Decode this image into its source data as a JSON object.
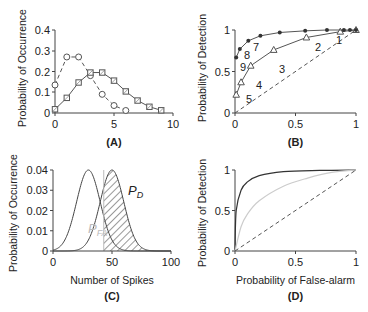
{
  "chart_data": [
    {
      "panel": "A",
      "type": "line",
      "caption": "(A)",
      "xlabel": "",
      "ylabel": "Probability of Occurrence",
      "xlim": [
        0,
        10
      ],
      "ylim": [
        0,
        0.4
      ],
      "xticks": [
        "0",
        "5",
        "10"
      ],
      "yticks": [
        "0",
        "0.1",
        "0.2",
        "0.3",
        "0.4"
      ],
      "series": [
        {
          "name": "circles (dashed)",
          "marker": "circle",
          "line": "dashed",
          "x": [
            0,
            1,
            2,
            3,
            4,
            5,
            6
          ],
          "values": [
            0.135,
            0.27,
            0.27,
            0.18,
            0.09,
            0.036,
            0.012
          ]
        },
        {
          "name": "squares (solid)",
          "marker": "square",
          "line": "solid",
          "x": [
            0,
            1,
            2,
            3,
            4,
            5,
            6,
            7,
            8,
            9
          ],
          "values": [
            0.018,
            0.073,
            0.147,
            0.195,
            0.195,
            0.156,
            0.104,
            0.06,
            0.03,
            0.013
          ]
        }
      ]
    },
    {
      "panel": "B",
      "type": "line",
      "caption": "(B)",
      "xlabel": "",
      "ylabel": "Probability of Detection",
      "xlim": [
        0,
        1
      ],
      "ylim": [
        0,
        1
      ],
      "xticks": [
        "0",
        "0.5",
        "1"
      ],
      "yticks": [
        "0",
        "0.5",
        "1"
      ],
      "series": [
        {
          "name": "triangles",
          "marker": "triangle",
          "line": "solid",
          "x": [
            0.01,
            0.05,
            0.13,
            0.32,
            0.59,
            0.87,
            1.0
          ],
          "values": [
            0.22,
            0.37,
            0.57,
            0.76,
            0.91,
            0.98,
            1.0
          ],
          "labels": [
            "",
            "5",
            "4",
            "3",
            "2",
            "1",
            ""
          ]
        },
        {
          "name": "filled dots",
          "marker": "dot",
          "line": "solid",
          "x": [
            0.01,
            0.04,
            0.11,
            0.21,
            0.37,
            0.58,
            0.76,
            0.9,
            0.95,
            1.0
          ],
          "values": [
            0.67,
            0.77,
            0.87,
            0.93,
            0.97,
            0.99,
            1.0,
            1.0,
            1.0,
            1.0
          ],
          "labels": [
            "9",
            "8",
            "7",
            "",
            "",
            "",
            "",
            "",
            "",
            ""
          ]
        },
        {
          "name": "chance",
          "line": "dashed",
          "x": [
            0,
            1
          ],
          "values": [
            0,
            1
          ]
        }
      ]
    },
    {
      "panel": "C",
      "type": "area",
      "caption": "(C)",
      "xlabel": "Number of Spikes",
      "ylabel": "Probability of Occurrence",
      "xlim": [
        0,
        100
      ],
      "ylim": [
        0,
        0.04
      ],
      "xticks": [
        "0",
        "50",
        "100"
      ],
      "yticks": [
        "0",
        "0.01",
        "0.02",
        "0.03",
        "0.04"
      ],
      "series": [
        {
          "name": "noise distribution",
          "mean": 30,
          "sd": 10,
          "peak": 0.04
        },
        {
          "name": "signal distribution",
          "mean": 50,
          "sd": 10,
          "peak": 0.04
        }
      ],
      "threshold": 43,
      "annotations": [
        "P_D",
        "P_FA"
      ]
    },
    {
      "panel": "D",
      "type": "line",
      "caption": "(D)",
      "xlabel": "Probability of False-alarm",
      "ylabel": "Probability of Detection",
      "xlim": [
        0,
        1
      ],
      "ylim": [
        0,
        1
      ],
      "xticks": [
        "0",
        "0.5",
        "1"
      ],
      "yticks": [
        "0",
        "0.5",
        "1"
      ],
      "series": [
        {
          "name": "high discriminability (dark)",
          "x": [
            0,
            0.01,
            0.05,
            0.1,
            0.2,
            0.4,
            0.7,
            1
          ],
          "values": [
            0,
            0.5,
            0.75,
            0.85,
            0.93,
            0.98,
            0.995,
            1
          ]
        },
        {
          "name": "low discriminability (light gray)",
          "x": [
            0,
            0.05,
            0.1,
            0.2,
            0.4,
            0.6,
            0.8,
            1
          ],
          "values": [
            0,
            0.3,
            0.45,
            0.62,
            0.8,
            0.9,
            0.97,
            1
          ]
        },
        {
          "name": "chance",
          "line": "dashed",
          "x": [
            0,
            1
          ],
          "values": [
            0,
            1
          ]
        }
      ]
    }
  ],
  "labels": {
    "a": {
      "ylabel": "Probability of Occurrence",
      "caption": "(A)",
      "xt0": "0",
      "xt1": "5",
      "xt2": "10",
      "yt0": "0",
      "yt1": "0.1",
      "yt2": "0.2",
      "yt3": "0.3",
      "yt4": "0.4"
    },
    "b": {
      "ylabel": "Probability of Detection",
      "caption": "(B)",
      "xt0": "0",
      "xt1": "0.5",
      "xt2": "1",
      "yt0": "0",
      "yt1": "0.5",
      "yt2": "1",
      "p1": "1",
      "p2": "2",
      "p3": "3",
      "p4": "4",
      "p5": "5",
      "p7": "7",
      "p8": "8",
      "p9": "9"
    },
    "c": {
      "ylabel": "Probability of Occurrence",
      "xlabel": "Number of Spikes",
      "caption": "(C)",
      "xt0": "0",
      "xt1": "50",
      "xt2": "100",
      "yt0": "0",
      "yt1": "0.01",
      "yt2": "0.02",
      "yt3": "0.03",
      "yt4": "0.04",
      "pd": "P",
      "pd_sub": "D",
      "pfa": "P",
      "pfa_sub": "FA"
    },
    "d": {
      "ylabel": "Probability of Detection",
      "xlabel": "Probability of False-alarm",
      "caption": "(D)",
      "xt0": "0",
      "xt1": "0.5",
      "xt2": "1",
      "yt0": "0",
      "yt1": "0.5",
      "yt2": "1"
    }
  }
}
